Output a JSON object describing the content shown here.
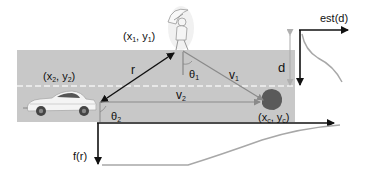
{
  "labels": {
    "pedestrian_pos": "(x",
    "pedestrian_sub1": "1",
    "pedestrian_mid": ", y",
    "pedestrian_sub2": "1",
    "pedestrian_end": ")",
    "car_pos": "(x",
    "car_sub1": "2",
    "car_mid": ", y",
    "car_sub2": "2",
    "car_end": ")",
    "obstacle_pos": "(x",
    "obstacle_sub1": "c",
    "obstacle_mid": ", y",
    "obstacle_sub2": "c",
    "obstacle_end": ")",
    "r": "r",
    "theta1": "θ",
    "theta1_sub": "1",
    "theta2": "θ",
    "theta2_sub": "2",
    "v1": "v",
    "v1_sub": "1",
    "v2": "v",
    "v2_sub": "2",
    "d": "d",
    "est_d": "est(d)",
    "f_r": "f(r)"
  },
  "colors": {
    "road": "#c8c8c8",
    "lane_dash": "#f2f2f2",
    "arrow_dark": "#111111",
    "vector_gray": "#8a8a8a",
    "curve_gray": "#a8a8a8",
    "obstacle": "#5a5a5a"
  }
}
